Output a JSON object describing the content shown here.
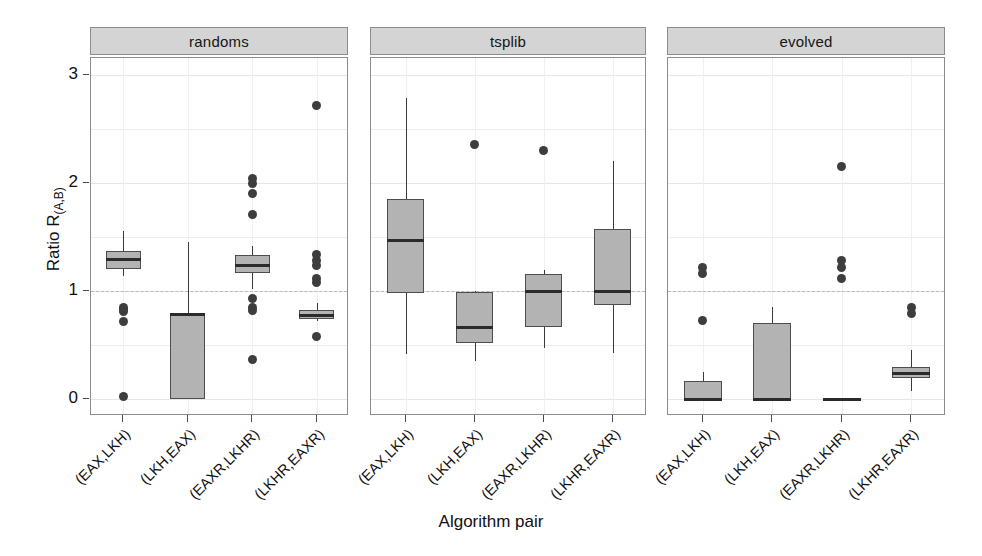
{
  "chart_data": {
    "type": "box",
    "title": "",
    "xlabel": "Algorithm pair",
    "ylabel": "Ratio R",
    "ylabel_sub": "(A,B)",
    "ylim": [
      -0.18,
      3.25
    ],
    "yticks": [
      0,
      1,
      2,
      3
    ],
    "ytick_labels": [
      "0",
      "1",
      "2",
      "3"
    ],
    "grid": true,
    "reference_line": 1,
    "facet_labels": [
      "randoms",
      "tsplib",
      "evolved"
    ],
    "categories": [
      "(EAX,LKH)",
      "(LKH,EAX)",
      "(EAXR,LKHR)",
      "(LKHR,EAXR)"
    ],
    "panels": [
      {
        "name": "randoms",
        "boxes": [
          {
            "category": "(EAX,LKH)",
            "whisker_low": 1.14,
            "q1": 1.2,
            "median": 1.29,
            "q3": 1.37,
            "whisker_high": 1.56,
            "outliers": [
              0.85,
              0.83,
              0.81,
              0.72,
              0.02
            ]
          },
          {
            "category": "(LKH,EAX)",
            "whisker_low": 0.0,
            "q1": 0.0,
            "median": 0.78,
            "q3": 0.79,
            "whisker_high": 1.45,
            "outliers": []
          },
          {
            "category": "(EAXR,LKHR)",
            "whisker_low": 1.02,
            "q1": 1.17,
            "median": 1.24,
            "q3": 1.33,
            "whisker_high": 1.42,
            "outliers": [
              2.04,
              2.0,
              1.9,
              1.71,
              0.93,
              0.85,
              0.82,
              0.37
            ]
          },
          {
            "category": "(LKHR,EAXR)",
            "whisker_low": 0.72,
            "q1": 0.74,
            "median": 0.77,
            "q3": 0.82,
            "whisker_high": 0.89,
            "outliers": [
              2.72,
              1.34,
              1.28,
              1.24,
              1.12,
              1.08,
              0.58
            ]
          }
        ]
      },
      {
        "name": "tsplib",
        "boxes": [
          {
            "category": "(EAX,LKH)",
            "whisker_low": 0.42,
            "q1": 0.98,
            "median": 1.47,
            "q3": 1.85,
            "whisker_high": 2.79,
            "outliers": []
          },
          {
            "category": "(LKH,EAX)",
            "whisker_low": 0.35,
            "q1": 0.52,
            "median": 0.66,
            "q3": 0.99,
            "whisker_high": 1.0,
            "outliers": [
              2.36
            ]
          },
          {
            "category": "(EAXR,LKHR)",
            "whisker_low": 0.47,
            "q1": 0.67,
            "median": 1.0,
            "q3": 1.16,
            "whisker_high": 1.19,
            "outliers": [
              2.3
            ]
          },
          {
            "category": "(LKHR,EAXR)",
            "whisker_low": 0.43,
            "q1": 0.87,
            "median": 1.0,
            "q3": 1.57,
            "whisker_high": 2.2,
            "outliers": []
          }
        ]
      },
      {
        "name": "evolved",
        "boxes": [
          {
            "category": "(EAX,LKH)",
            "whisker_low": 0.0,
            "q1": 0.0,
            "median": 0.0,
            "q3": 0.17,
            "whisker_high": 0.25,
            "outliers": [
              1.22,
              1.16,
              0.73
            ]
          },
          {
            "category": "(LKH,EAX)",
            "whisker_low": 0.0,
            "q1": 0.0,
            "median": 0.0,
            "q3": 0.7,
            "whisker_high": 0.85,
            "outliers": []
          },
          {
            "category": "(EAXR,LKHR)",
            "whisker_low": 0.0,
            "q1": 0.0,
            "median": 0.0,
            "q3": 0.0,
            "whisker_high": 0.0,
            "outliers": [
              2.15,
              1.28,
              1.22,
              1.12
            ]
          },
          {
            "category": "(LKHR,EAXR)",
            "whisker_low": 0.07,
            "q1": 0.19,
            "median": 0.24,
            "q3": 0.3,
            "whisker_high": 0.45,
            "outliers": [
              0.85,
              0.79
            ]
          }
        ]
      }
    ]
  },
  "colors": {
    "box_fill": "#b3b3b3",
    "box_border": "#4d4d4d",
    "median": "#2b2b2b",
    "outlier": "#3d3d3d",
    "strip_bg": "#d4d4d4",
    "panel_border": "#8c8c8c",
    "grid": "#ededed",
    "reference": "#b9b9b9",
    "background": "#ffffff"
  }
}
